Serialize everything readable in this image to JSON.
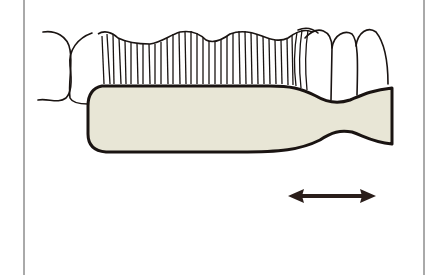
{
  "figure": {
    "motion": "horizontal back-and-forth scrubbing",
    "colors": {
      "background": "#ffffff",
      "line": "#1a1412",
      "brush_fill": "#e8e6d6",
      "frame": "#555555"
    },
    "elements": [
      "left-frame-line",
      "right-frame-line",
      "teeth-outline",
      "bristles",
      "brush-head-and-handle",
      "double-headed-arrow"
    ]
  }
}
